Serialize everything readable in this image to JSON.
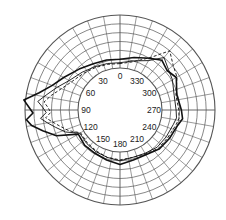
{
  "chart_data": {
    "type": "polar-line",
    "title": "",
    "angle_direction": "counterclockwise",
    "zero_location": "top",
    "angle_labels": [
      "0",
      "30",
      "60",
      "90",
      "120",
      "150",
      "180",
      "210",
      "240",
      "270",
      "300",
      "330"
    ],
    "angle_label_degrees": [
      0,
      30,
      60,
      90,
      120,
      150,
      180,
      210,
      240,
      270,
      300,
      330
    ],
    "grid": {
      "spoke_step_deg": 10,
      "rings": 6,
      "inner_radius_px": 42,
      "outer_radius_px": 95
    },
    "radial_range": [
      0,
      6
    ],
    "angles_deg": [
      0,
      15,
      30,
      45,
      60,
      70,
      78,
      84,
      88,
      92,
      96,
      100,
      105,
      112,
      120,
      135,
      150,
      165,
      180,
      195,
      210,
      225,
      240,
      255,
      262,
      270,
      285,
      300,
      310,
      320,
      330,
      345
    ],
    "series": [
      {
        "name": "thick-solid",
        "style": "solid",
        "width": 1.6,
        "values": [
          1.0,
          1.1,
          1.3,
          1.8,
          2.6,
          3.4,
          4.6,
          6.2,
          5.6,
          5.1,
          5.9,
          5.4,
          4.3,
          3.0,
          0.7,
          0.9,
          0.9,
          1.1,
          1.4,
          1.1,
          1.1,
          1.5,
          1.7,
          2.0,
          2.4,
          2.2,
          1.9,
          2.6,
          2.2,
          2.6,
          2.0,
          1.4
        ]
      },
      {
        "name": "thin-solid",
        "style": "solid",
        "width": 0.9,
        "values": [
          0.6,
          0.7,
          0.9,
          1.3,
          1.9,
          2.8,
          3.7,
          4.6,
          4.0,
          3.6,
          4.3,
          3.6,
          2.8,
          1.9,
          0.5,
          0.6,
          0.7,
          0.8,
          1.0,
          0.8,
          0.9,
          1.2,
          1.3,
          1.5,
          1.7,
          1.6,
          1.6,
          2.1,
          2.4,
          3.0,
          1.7,
          1.0
        ]
      },
      {
        "name": "dashed",
        "style": "dashed",
        "width": 0.9,
        "values": [
          0.5,
          0.6,
          0.8,
          1.1,
          1.6,
          2.3,
          3.2,
          3.9,
          3.4,
          3.1,
          3.7,
          3.0,
          2.3,
          1.5,
          0.4,
          0.5,
          0.6,
          0.8,
          0.9,
          0.8,
          1.0,
          1.4,
          1.5,
          1.8,
          2.0,
          1.9,
          1.8,
          2.7,
          3.1,
          4.0,
          2.1,
          0.9
        ]
      }
    ],
    "colors": {
      "grid": "#555555",
      "lines": "#111111",
      "background": "#ffffff"
    }
  }
}
